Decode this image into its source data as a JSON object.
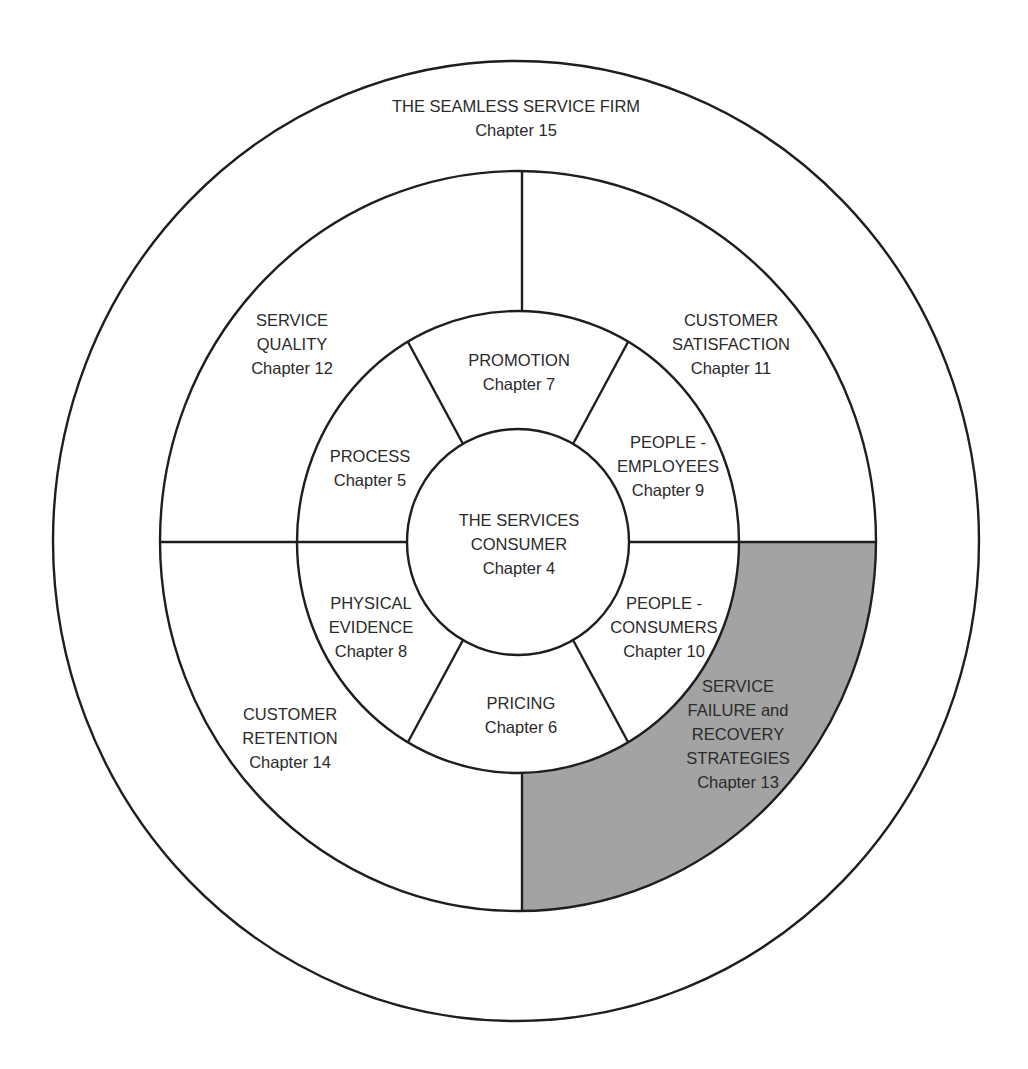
{
  "diagram": {
    "type": "concentric-wheel",
    "colors": {
      "line": "#1e1e1e",
      "text": "#2a2a2a",
      "highlight_fill": "#a3a3a3",
      "background": "#ffffff"
    },
    "outer": {
      "title": "THE SEAMLESS SERVICE FIRM",
      "chapter": "Chapter 15"
    },
    "center": {
      "line1": "THE SERVICES",
      "line2": "CONSUMER",
      "chapter": "Chapter 4"
    },
    "inner_segments": [
      {
        "id": "promotion",
        "line1": "PROMOTION",
        "chapter": "Chapter 7"
      },
      {
        "id": "people-employees",
        "line1": "PEOPLE -",
        "line2": "EMPLOYEES",
        "chapter": "Chapter 9"
      },
      {
        "id": "people-consumers",
        "line1": "PEOPLE -",
        "line2": "CONSUMERS",
        "chapter": "Chapter 10"
      },
      {
        "id": "pricing",
        "line1": "PRICING",
        "chapter": "Chapter 6"
      },
      {
        "id": "physical-evidence",
        "line1": "PHYSICAL",
        "line2": "EVIDENCE",
        "chapter": "Chapter 8"
      },
      {
        "id": "process",
        "line1": "PROCESS",
        "chapter": "Chapter 5"
      }
    ],
    "quadrants": [
      {
        "id": "service-quality",
        "line1": "SERVICE",
        "line2": "QUALITY",
        "chapter": "Chapter 12",
        "highlighted": false
      },
      {
        "id": "customer-satisfaction",
        "line1": "CUSTOMER",
        "line2": "SATISFACTION",
        "chapter": "Chapter 11",
        "highlighted": false
      },
      {
        "id": "service-failure-recovery",
        "line1": "SERVICE",
        "line2": "FAILURE and",
        "line3": "RECOVERY",
        "line4": "STRATEGIES",
        "chapter": "Chapter 13",
        "highlighted": true
      },
      {
        "id": "customer-retention",
        "line1": "CUSTOMER",
        "line2": "RETENTION",
        "chapter": "Chapter 14",
        "highlighted": false
      }
    ]
  }
}
